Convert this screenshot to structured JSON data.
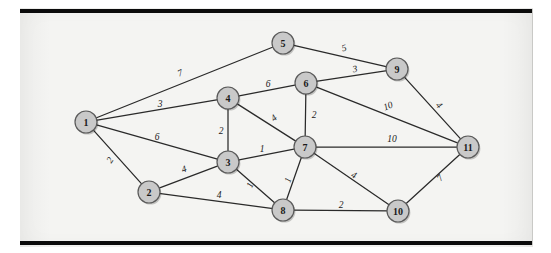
{
  "figure": {
    "background_color": "#f4f4f2",
    "page_color": "#ffffff",
    "rule_color": "#0b0b0b",
    "node_fill": "#c9c9c9",
    "node_stroke": "#5a5a5a",
    "edge_color": "#2a2a2a",
    "label_color": "#1a1a1a"
  },
  "chart_data": {
    "type": "diagram",
    "subtype": "weighted-undirected-graph",
    "title": "",
    "xlabel": "",
    "ylabel": "",
    "grid": false,
    "legend": null,
    "node_count": 11,
    "edge_count": 21,
    "nodes": [
      {
        "id": "1",
        "label": "1",
        "x": 86,
        "y": 122,
        "r": 11
      },
      {
        "id": "2",
        "label": "2",
        "x": 149,
        "y": 192,
        "r": 11
      },
      {
        "id": "3",
        "label": "3",
        "x": 228,
        "y": 162,
        "r": 11
      },
      {
        "id": "4",
        "label": "4",
        "x": 228,
        "y": 98,
        "r": 11
      },
      {
        "id": "5",
        "label": "5",
        "x": 283,
        "y": 43,
        "r": 11
      },
      {
        "id": "6",
        "label": "6",
        "x": 306,
        "y": 83,
        "r": 11
      },
      {
        "id": "7",
        "label": "7",
        "x": 305,
        "y": 147,
        "r": 11
      },
      {
        "id": "8",
        "label": "8",
        "x": 283,
        "y": 210,
        "r": 11
      },
      {
        "id": "9",
        "label": "9",
        "x": 397,
        "y": 69,
        "r": 11
      },
      {
        "id": "10",
        "label": "10",
        "x": 398,
        "y": 211,
        "r": 11
      },
      {
        "id": "11",
        "label": "11",
        "x": 468,
        "y": 147,
        "r": 11
      }
    ],
    "edges": [
      {
        "source": "1",
        "target": "5",
        "weight": 7,
        "label": "7",
        "lx": 180,
        "ly": 73,
        "rotate": -22
      },
      {
        "source": "1",
        "target": "4",
        "weight": 3,
        "label": "3",
        "lx": 160,
        "ly": 104,
        "rotate": 0
      },
      {
        "source": "1",
        "target": "3",
        "weight": 6,
        "label": "6",
        "lx": 157,
        "ly": 137,
        "rotate": 0
      },
      {
        "source": "1",
        "target": "2",
        "weight": 2,
        "label": "2",
        "lx": 110,
        "ly": 160,
        "rotate": -57
      },
      {
        "source": "2",
        "target": "3",
        "weight": 4,
        "label": "4",
        "lx": 184,
        "ly": 169,
        "rotate": -20
      },
      {
        "source": "2",
        "target": "8",
        "weight": 4,
        "label": "4",
        "lx": 219,
        "ly": 195,
        "rotate": 0
      },
      {
        "source": "3",
        "target": "4",
        "weight": 2,
        "label": "2",
        "lx": 221,
        "ly": 131,
        "rotate": 0
      },
      {
        "source": "3",
        "target": "7",
        "weight": 1,
        "label": "1",
        "lx": 262,
        "ly": 149,
        "rotate": 0
      },
      {
        "source": "3",
        "target": "8",
        "weight": 1,
        "label": "1",
        "lx": 250,
        "ly": 185,
        "rotate": -66
      },
      {
        "source": "4",
        "target": "6",
        "weight": 6,
        "label": "6",
        "lx": 268,
        "ly": 84,
        "rotate": 0
      },
      {
        "source": "4",
        "target": "7",
        "weight": 4,
        "label": "4",
        "lx": 274,
        "ly": 118,
        "rotate": -40
      },
      {
        "source": "5",
        "target": "9",
        "weight": 5,
        "label": "5",
        "lx": 344,
        "ly": 48,
        "rotate": -14
      },
      {
        "source": "6",
        "target": "9",
        "weight": 3,
        "label": "3",
        "lx": 355,
        "ly": 69,
        "rotate": -12
      },
      {
        "source": "6",
        "target": "7",
        "weight": 2,
        "label": "2",
        "lx": 314,
        "ly": 115,
        "rotate": 0
      },
      {
        "source": "6",
        "target": "11",
        "weight": 10,
        "label": "10",
        "lx": 388,
        "ly": 106,
        "rotate": -21
      },
      {
        "source": "7",
        "target": "8",
        "weight": 1,
        "label": "1",
        "lx": 288,
        "ly": 180,
        "rotate": -71
      },
      {
        "source": "7",
        "target": "11",
        "weight": 10,
        "label": "10",
        "lx": 392,
        "ly": 139,
        "rotate": 0
      },
      {
        "source": "7",
        "target": "10",
        "weight": 4,
        "label": "4",
        "lx": 354,
        "ly": 175,
        "rotate": 26
      },
      {
        "source": "8",
        "target": "10",
        "weight": 2,
        "label": "2",
        "lx": 341,
        "ly": 205,
        "rotate": 0
      },
      {
        "source": "9",
        "target": "11",
        "weight": 4,
        "label": "4",
        "lx": 439,
        "ly": 105,
        "rotate": 46
      },
      {
        "source": "10",
        "target": "11",
        "weight": 7,
        "label": "7",
        "lx": 440,
        "ly": 178,
        "rotate": -49
      }
    ]
  }
}
